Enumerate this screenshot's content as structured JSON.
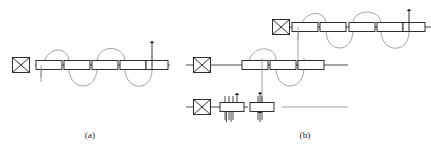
{
  "figure": {
    "background_color": "#ffffff",
    "line_color_dark": "#1a1a1a",
    "line_color_light": "#8a8a8a",
    "box_fill": "#ffffff",
    "captions": [
      {
        "id": "a",
        "label": "(a)"
      },
      {
        "id": "b",
        "label": "(b)"
      }
    ]
  },
  "panel_a": {
    "name": "single-row-threading-diagram",
    "rows": [
      {
        "name": "row-main",
        "y": 65,
        "rail_x1": 35,
        "rail_x2": 168,
        "crossed_box": {
          "name": "crossed-box-symbol",
          "cx": 21,
          "cy": 65,
          "w": 17,
          "h": 15
        },
        "boxes": [
          {
            "cx": 49,
            "cy": 65,
            "w": 26,
            "h": 9
          },
          {
            "cx": 77,
            "cy": 65,
            "w": 26,
            "h": 9
          },
          {
            "cx": 105,
            "cy": 65,
            "w": 26,
            "h": 9
          },
          {
            "cx": 133,
            "cy": 65,
            "w": 26,
            "h": 9
          },
          {
            "cx": 157,
            "cy": 65,
            "w": 22,
            "h": 9
          }
        ],
        "arrows": [
          {
            "name": "up-arrow",
            "x": 150,
            "y_tail": 65,
            "y_head": 38,
            "dir": "up"
          }
        ],
        "stem": {
          "x": 49,
          "y_top": 65,
          "y_bottom": 81
        }
      }
    ],
    "serpentine": {
      "name": "threading-path",
      "loops_above": 2,
      "loops_below": 2
    }
  },
  "panel_b": {
    "name": "three-row-threading-diagram",
    "rows": [
      {
        "name": "row-top",
        "y": 27,
        "rail_x1": 272,
        "rail_x2": 431,
        "crossed_box": {
          "name": "crossed-box-symbol",
          "cx": 281,
          "cy": 27,
          "w": 17,
          "h": 15
        },
        "boxes": [
          {
            "cx": 305,
            "cy": 27,
            "w": 26,
            "h": 9
          },
          {
            "cx": 333,
            "cy": 27,
            "w": 26,
            "h": 9
          },
          {
            "cx": 362,
            "cy": 27,
            "w": 26,
            "h": 9
          },
          {
            "cx": 390,
            "cy": 27,
            "w": 26,
            "h": 9
          },
          {
            "cx": 414,
            "cy": 27,
            "w": 22,
            "h": 9
          }
        ],
        "arrows": [
          {
            "name": "up-arrow",
            "x": 407,
            "y_tail": 27,
            "y_head": 6,
            "dir": "up"
          }
        ]
      },
      {
        "name": "row-middle",
        "y": 65,
        "rail_x1": 186,
        "rail_x2": 348,
        "crossed_box": {
          "name": "crossed-box-symbol",
          "cx": 202,
          "cy": 65,
          "w": 17,
          "h": 15
        },
        "boxes": [
          {
            "cx": 255,
            "cy": 65,
            "w": 26,
            "h": 9
          },
          {
            "cx": 283,
            "cy": 65,
            "w": 26,
            "h": 9
          },
          {
            "cx": 311,
            "cy": 65,
            "w": 26,
            "h": 9
          }
        ],
        "arrows": []
      },
      {
        "name": "row-bottom",
        "y": 107,
        "rail_x1": 186,
        "rail_x2": 248,
        "rail2_x1": 282,
        "rail2_x2": 348,
        "crossed_box": {
          "name": "crossed-box-symbol",
          "cx": 202,
          "cy": 107,
          "w": 17,
          "h": 15
        },
        "boxes": [
          {
            "cx": 232,
            "cy": 107,
            "w": 24,
            "h": 9
          },
          {
            "cx": 262,
            "cy": 107,
            "w": 24,
            "h": 9
          }
        ],
        "arrows": [
          {
            "name": "up-arrow",
            "x": 237,
            "y_tail": 112,
            "y_head": 92,
            "dir": "up"
          },
          {
            "name": "down-arrow",
            "x": 228,
            "y_tail": 96,
            "y_head": 121,
            "dir": "down"
          },
          {
            "name": "up-arrow",
            "x": 232,
            "y_tail": 121,
            "y_head": 97,
            "dir": "up"
          },
          {
            "name": "down-arrow",
            "x": 261,
            "y_tail": 94,
            "y_head": 120,
            "dir": "down"
          },
          {
            "name": "up-arrow",
            "x": 259,
            "y_tail": 120,
            "y_head": 93,
            "dir": "up"
          }
        ]
      }
    ],
    "connectors": [
      {
        "name": "vertical-connector-top-to-middle",
        "x": 305,
        "y1": 27,
        "y2": 65
      },
      {
        "name": "vertical-connector-middle-to-bottom",
        "x": 262,
        "y1": 55,
        "y2": 107
      }
    ],
    "serpentine_top": {
      "name": "threading-path-top",
      "loops_above": 2,
      "loops_below": 2
    },
    "serpentine_middle": {
      "name": "threading-path-middle",
      "loops_above": 1,
      "loops_below": 1
    }
  }
}
